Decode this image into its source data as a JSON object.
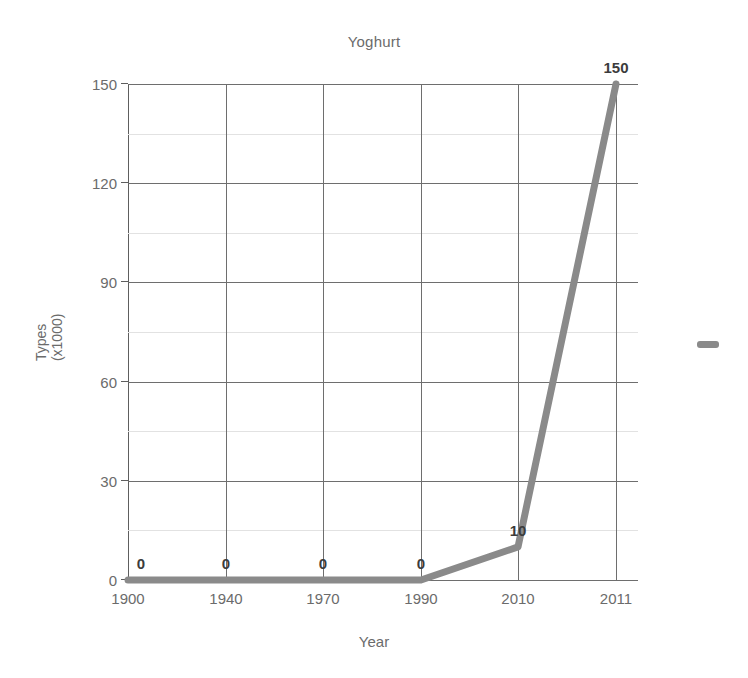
{
  "chart_data": {
    "type": "line",
    "title": "Yoghurt",
    "xlabel": "Year",
    "ylabel": "Types\n(x1000)",
    "ylabel_line1": "Types",
    "ylabel_line2": "(x1000)",
    "categories": [
      "1900",
      "1940",
      "1970",
      "1990",
      "2010",
      "2011"
    ],
    "values": [
      0,
      0,
      0,
      0,
      10,
      150
    ],
    "point_labels": [
      "0",
      "0",
      "0",
      "0",
      "10",
      "150"
    ],
    "ylim": [
      0,
      150
    ],
    "yticks": [
      0,
      30,
      60,
      90,
      120,
      150
    ],
    "ytick_labels": [
      "0",
      "30",
      "60",
      "90",
      "120",
      "150"
    ],
    "minor_yticks": [
      15,
      45,
      75,
      105,
      135
    ],
    "grid": true,
    "legend_position": "right",
    "series": [
      {
        "name": "",
        "color": "#8a8a8a",
        "values": [
          0,
          0,
          0,
          0,
          10,
          150
        ]
      }
    ],
    "colors": {
      "line": "#8a8a8a",
      "grid_major": "#6e6e6e",
      "grid_minor": "#e2e2e2",
      "axis": "#5e5e5e",
      "text": "#6b6b6b",
      "label_text": "#3c3c3c",
      "background": "#ffffff"
    },
    "legend": {
      "swatch_color": "#8a8a8a",
      "label": ""
    }
  }
}
